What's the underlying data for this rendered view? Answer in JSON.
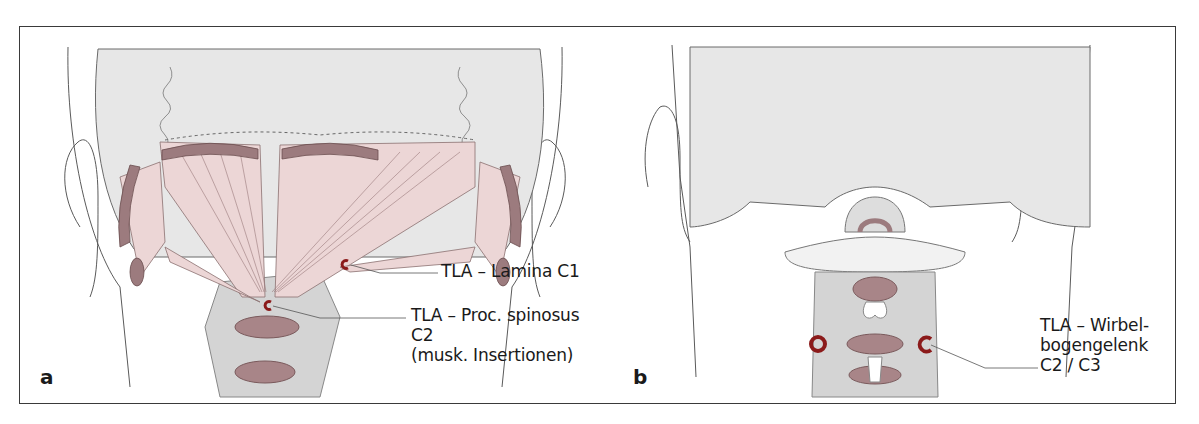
{
  "figure": {
    "panels": [
      {
        "id": "a",
        "letter": "a",
        "description": "Posterior view of head/neck with suboccipital muscles",
        "labels": [
          {
            "id": "lamina-c1",
            "lines": [
              "TLA – Lamina C1"
            ]
          },
          {
            "id": "proc-spinosus-c2",
            "lines": [
              "TLA – Proc. spinosus",
              "C2",
              "(musk. Insertionen)"
            ]
          }
        ],
        "markers": [
          {
            "target": "lamina-c1",
            "shape": "c-ring"
          },
          {
            "target": "proc-spinosus-c2",
            "shape": "c-ring"
          }
        ]
      },
      {
        "id": "b",
        "letter": "b",
        "description": "Posterior view of head/neck showing cervical vertebrae",
        "labels": [
          {
            "id": "wirbelbogengelenk",
            "lines": [
              "TLA – Wirbel-",
              "bogengelenk",
              "C2 / C3"
            ]
          }
        ],
        "markers": [
          {
            "target": "wirbelbogengelenk",
            "shape": "ring-left"
          },
          {
            "target": "wirbelbogengelenk",
            "shape": "c-ring-right"
          }
        ]
      }
    ],
    "colors": {
      "skin": "#e6e6e6",
      "outline": "#5a5a5a",
      "muscle": "#ecd6d6",
      "muscle_dark": "#9c7b7e",
      "bone": "#cfcfcf",
      "marker": "#8b1a1a",
      "frame": "#3a3a3a"
    }
  }
}
